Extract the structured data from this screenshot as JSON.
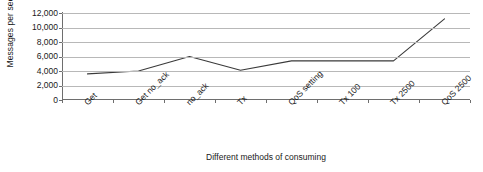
{
  "chart_data": {
    "type": "line",
    "title": "",
    "xlabel": "Different methods of consuming",
    "ylabel": "Messages per second",
    "categories": [
      "Get",
      "Get no_ack",
      "no_ack",
      "Tx",
      "QoS setting",
      "Tx 100",
      "Tx 2500",
      "QoS 2500"
    ],
    "values": [
      3600,
      4000,
      6000,
      4100,
      5400,
      5400,
      5400,
      11200
    ],
    "series": [
      {
        "name": "Messages per second",
        "values": [
          3600,
          4000,
          6000,
          4100,
          5400,
          5400,
          5400,
          11200
        ]
      }
    ],
    "ylim": [
      0,
      12000
    ],
    "ytick_interval": 2000,
    "ytick_labels": [
      "12,000",
      "10,000",
      "8,000",
      "6,000",
      "4,000",
      "2,000",
      "0"
    ],
    "ytick_values": [
      12000,
      10000,
      8000,
      6000,
      4000,
      2000,
      0
    ],
    "grid": true,
    "grid_axis": "y",
    "legend": false,
    "legend_position": "none",
    "colors": {
      "line": "#3a3a3a",
      "grid": "#b8b8b8",
      "axis": "#6e6e6e",
      "text": "#1a1a1a",
      "background": "#ffffff"
    }
  }
}
